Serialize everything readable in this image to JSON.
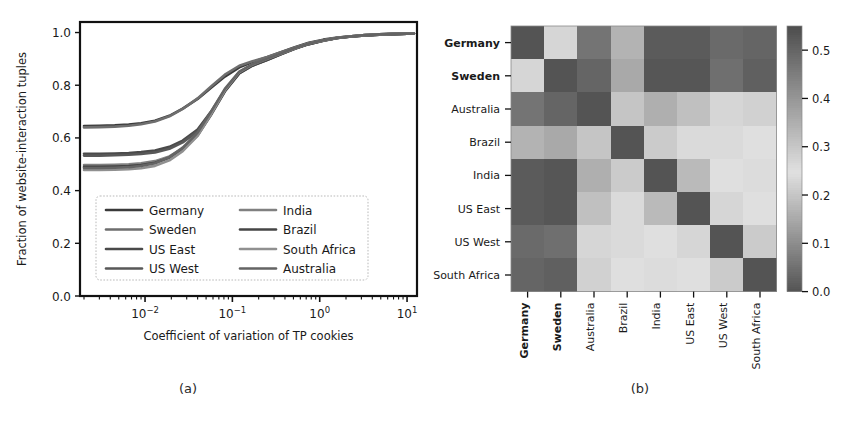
{
  "figure": {
    "captions": {
      "a": "(a)",
      "b": "(b)"
    }
  },
  "chart_data": [
    {
      "panel": "a",
      "type": "line",
      "title": "",
      "xlabel": "Coefficient of variation of TP cookies",
      "ylabel": "Fraction of website-interaction tuples",
      "xscale": "log",
      "xlim": [
        0.0018,
        13.0
      ],
      "ylim": [
        0.0,
        1.04
      ],
      "ytick_labels": [
        "0.0",
        "0.2",
        "0.4",
        "0.6",
        "0.8",
        "1.0"
      ],
      "ytick_values": [
        0.0,
        0.2,
        0.4,
        0.6,
        0.8,
        1.0
      ],
      "xtick_labels": [
        "10-2",
        "10-1",
        "100",
        "101"
      ],
      "xtick_mantissa": [
        "10",
        "10",
        "10",
        "10"
      ],
      "xtick_exponent": [
        "−2",
        "−1",
        "0",
        "1"
      ],
      "xtick_values": [
        0.01,
        0.1,
        1.0,
        10.0
      ],
      "grid": false,
      "legend_position": "lower center",
      "legend_ncols": 2,
      "legend_entries": [
        "Germany",
        "Sweden",
        "US East",
        "US West",
        "India",
        "Brazil",
        "South Africa",
        "Australia"
      ],
      "x": [
        0.002,
        0.003,
        0.0045,
        0.0065,
        0.009,
        0.013,
        0.019,
        0.027,
        0.04,
        0.057,
        0.082,
        0.12,
        0.17,
        0.25,
        0.36,
        0.52,
        0.75,
        1.1,
        1.6,
        2.3,
        3.3,
        4.8,
        7.0,
        10.0,
        12.0
      ],
      "series": [
        {
          "name": "Germany",
          "values": [
            0.645,
            0.646,
            0.648,
            0.651,
            0.656,
            0.665,
            0.684,
            0.711,
            0.748,
            0.79,
            0.833,
            0.868,
            0.888,
            0.906,
            0.925,
            0.944,
            0.961,
            0.973,
            0.981,
            0.986,
            0.99,
            0.993,
            0.995,
            0.996,
            0.996
          ]
        },
        {
          "name": "Sweden",
          "values": [
            0.64,
            0.641,
            0.643,
            0.646,
            0.652,
            0.662,
            0.682,
            0.71,
            0.75,
            0.795,
            0.84,
            0.874,
            0.891,
            0.907,
            0.925,
            0.943,
            0.959,
            0.971,
            0.98,
            0.986,
            0.99,
            0.993,
            0.995,
            0.996,
            0.996
          ]
        },
        {
          "name": "US East",
          "values": [
            0.54,
            0.54,
            0.541,
            0.543,
            0.546,
            0.552,
            0.566,
            0.59,
            0.632,
            0.7,
            0.782,
            0.848,
            0.876,
            0.897,
            0.918,
            0.939,
            0.957,
            0.97,
            0.979,
            0.985,
            0.989,
            0.992,
            0.994,
            0.996,
            0.996
          ]
        },
        {
          "name": "US West",
          "values": [
            0.533,
            0.533,
            0.534,
            0.536,
            0.539,
            0.545,
            0.559,
            0.583,
            0.625,
            0.695,
            0.779,
            0.846,
            0.874,
            0.896,
            0.917,
            0.938,
            0.956,
            0.969,
            0.979,
            0.985,
            0.989,
            0.992,
            0.994,
            0.996,
            0.996
          ]
        },
        {
          "name": "India",
          "values": [
            0.497,
            0.497,
            0.498,
            0.5,
            0.504,
            0.512,
            0.53,
            0.56,
            0.612,
            0.69,
            0.779,
            0.848,
            0.877,
            0.899,
            0.919,
            0.94,
            0.957,
            0.97,
            0.979,
            0.985,
            0.989,
            0.992,
            0.995,
            0.996,
            0.996
          ]
        },
        {
          "name": "Brazil",
          "values": [
            0.49,
            0.49,
            0.491,
            0.493,
            0.497,
            0.506,
            0.525,
            0.557,
            0.61,
            0.688,
            0.776,
            0.845,
            0.875,
            0.897,
            0.918,
            0.939,
            0.956,
            0.969,
            0.979,
            0.985,
            0.989,
            0.992,
            0.994,
            0.996,
            0.996
          ]
        },
        {
          "name": "South Africa",
          "values": [
            0.478,
            0.478,
            0.479,
            0.481,
            0.485,
            0.494,
            0.515,
            0.55,
            0.608,
            0.69,
            0.781,
            0.85,
            0.879,
            0.9,
            0.92,
            0.94,
            0.958,
            0.97,
            0.98,
            0.986,
            0.99,
            0.993,
            0.995,
            0.996,
            0.996
          ]
        },
        {
          "name": "Australia",
          "values": [
            0.486,
            0.486,
            0.487,
            0.489,
            0.494,
            0.504,
            0.527,
            0.563,
            0.62,
            0.7,
            0.786,
            0.852,
            0.88,
            0.901,
            0.921,
            0.941,
            0.958,
            0.971,
            0.98,
            0.986,
            0.99,
            0.993,
            0.995,
            0.996,
            0.996
          ]
        }
      ]
    },
    {
      "panel": "b",
      "type": "heatmap",
      "title": "",
      "xlabel": "",
      "ylabel": "",
      "row_labels": [
        "Germany",
        "Sweden",
        "Australia",
        "Brazil",
        "India",
        "US East",
        "US West",
        "South Africa"
      ],
      "col_labels": [
        "Germany",
        "Sweden",
        "Australia",
        "Brazil",
        "India",
        "US East",
        "US West",
        "South Africa"
      ],
      "bold_labels": [
        "Germany",
        "Sweden"
      ],
      "colorbar_ticks": [
        "0.0",
        "0.1",
        "0.2",
        "0.3",
        "0.4",
        "0.5"
      ],
      "colorbar_tick_values": [
        0.0,
        0.1,
        0.2,
        0.3,
        0.4,
        0.5
      ],
      "vmin": 0.0,
      "vmax": 0.55,
      "values": [
        [
          0.0,
          0.23,
          0.47,
          0.34,
          0.52,
          0.52,
          0.49,
          0.5
        ],
        [
          0.23,
          0.0,
          0.5,
          0.36,
          0.53,
          0.53,
          0.48,
          0.51
        ],
        [
          0.47,
          0.5,
          0.0,
          0.2,
          0.16,
          0.19,
          0.23,
          0.22
        ],
        [
          0.34,
          0.36,
          0.2,
          0.0,
          0.21,
          0.26,
          0.26,
          0.25
        ],
        [
          0.52,
          0.53,
          0.16,
          0.21,
          0.0,
          0.18,
          0.25,
          0.24
        ],
        [
          0.52,
          0.53,
          0.19,
          0.26,
          0.18,
          0.0,
          0.23,
          0.25
        ],
        [
          0.49,
          0.48,
          0.23,
          0.26,
          0.25,
          0.23,
          0.0,
          0.21
        ],
        [
          0.5,
          0.51,
          0.22,
          0.25,
          0.24,
          0.25,
          0.21,
          0.0
        ]
      ]
    }
  ]
}
